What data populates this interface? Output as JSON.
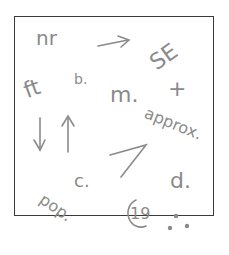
{
  "sketch": {
    "labels": {
      "nr": "nr",
      "b": "b.",
      "ft": "ft",
      "se": "SE",
      "m": "m.",
      "plus": "+",
      "approx": "approx.",
      "c": "c.",
      "d": "d.",
      "pop": "pop.",
      "copyright_year": "19"
    },
    "ink_color": "#8a8a8a",
    "frame_color": "#3a3a3a"
  }
}
